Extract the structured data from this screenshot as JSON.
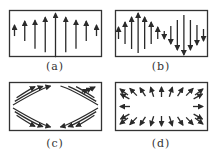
{
  "figure": {
    "line_color": "#2a2a2a",
    "panels": [
      {
        "id": "a",
        "label": "(a)",
        "pattern": "vertical-arrows-up",
        "arrow_direction": "up",
        "relative_magnitudes": [
          0.25,
          0.45,
          0.65,
          0.8,
          1.0,
          0.8,
          0.65,
          0.45,
          0.25
        ]
      },
      {
        "id": "b",
        "label": "(b)",
        "pattern": "vertical-arrows-sinusoidal",
        "relative_magnitudes": [
          0.3,
          0.55,
          0.8,
          1.0,
          0.8,
          0.55,
          0.3,
          -0.2,
          -0.45,
          -0.75,
          -1.0,
          -0.75,
          -0.5,
          -0.3
        ]
      },
      {
        "id": "c",
        "label": "(c)",
        "pattern": "hyperbolic-curves-converging-center"
      },
      {
        "id": "d",
        "label": "(d)",
        "pattern": "radial-arrows-outward-from-center",
        "arrow_direction": "outward"
      }
    ]
  }
}
